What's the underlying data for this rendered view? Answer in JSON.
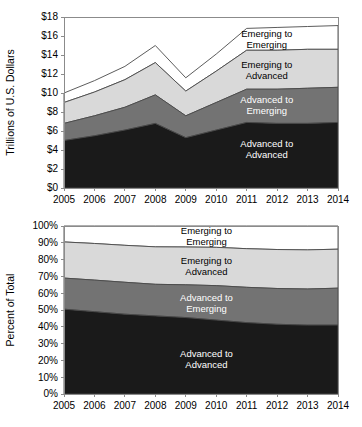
{
  "figure": {
    "background": "#ffffff",
    "series_colors": {
      "advanced_to_advanced": "#1a1a1a",
      "advanced_to_emerging": "#737373",
      "emerging_to_advanced": "#d9d9d9",
      "emerging_to_emerging": "#ffffff"
    },
    "outline_color": "#4a4a4a",
    "axis_color": "#8b8b8b"
  },
  "charts": [
    {
      "id": "top",
      "type": "area",
      "title": "",
      "xlabel": "",
      "ylabel": "Trillions of U.S. Dollars",
      "stacked": true,
      "grid": false,
      "legend_position": "inline-annotations",
      "x": [
        2005,
        2006,
        2007,
        2008,
        2009,
        2010,
        2011,
        2012,
        2013,
        2014
      ],
      "xtick_labels": [
        "2005",
        "2006",
        "2007",
        "2008",
        "2009",
        "2010",
        "2011",
        "2012",
        "2013",
        "2014"
      ],
      "ytick_labels": [
        "$0",
        "$2",
        "$4",
        "$6",
        "$8",
        "$10",
        "$12",
        "$14",
        "$16",
        "$18"
      ],
      "ytick_values": [
        0,
        2,
        4,
        6,
        8,
        10,
        12,
        14,
        16,
        18
      ],
      "ylim": [
        0,
        18
      ],
      "series": [
        {
          "name": "Advanced to Advanced",
          "label_lines": [
            "Advanced to",
            "Advanced"
          ],
          "color_key": "advanced_to_advanced",
          "label_color": "light",
          "values": [
            5.0,
            5.5,
            6.1,
            6.8,
            5.3,
            6.1,
            6.9,
            6.8,
            6.8,
            6.9
          ]
        },
        {
          "name": "Advanced to Emerging",
          "label_lines": [
            "Advanced to",
            "Emerging"
          ],
          "color_key": "advanced_to_emerging",
          "label_color": "light",
          "values": [
            1.8,
            2.1,
            2.4,
            3.0,
            2.3,
            2.9,
            3.5,
            3.6,
            3.7,
            3.7
          ]
        },
        {
          "name": "Emerging to Advanced",
          "label_lines": [
            "Emerging to",
            "Advanced"
          ],
          "color_key": "emerging_to_advanced",
          "label_color": "dark",
          "values": [
            2.2,
            2.5,
            2.9,
            3.4,
            2.6,
            3.3,
            4.1,
            4.1,
            4.1,
            4.0
          ]
        },
        {
          "name": "Emerging to Emerging",
          "label_lines": [
            "Emerging to",
            "Emerging"
          ],
          "color_key": "emerging_to_emerging",
          "label_color": "dark",
          "values": [
            1.0,
            1.2,
            1.4,
            1.8,
            1.4,
            1.8,
            2.3,
            2.4,
            2.4,
            2.5
          ]
        }
      ],
      "annotations": [
        {
          "text_lines": [
            "Emerging to",
            "Emerging"
          ],
          "x_frac": 0.74,
          "y_value": 15.9,
          "color": "dark"
        },
        {
          "text_lines": [
            "Emerging to",
            "Advanced"
          ],
          "x_frac": 0.74,
          "y_value": 12.6,
          "color": "dark"
        },
        {
          "text_lines": [
            "Advanced to",
            "Emerging"
          ],
          "x_frac": 0.74,
          "y_value": 8.9,
          "color": "light"
        },
        {
          "text_lines": [
            "Advanced to",
            "Advanced"
          ],
          "x_frac": 0.74,
          "y_value": 4.3,
          "color": "light"
        }
      ]
    },
    {
      "id": "bottom",
      "type": "area",
      "title": "",
      "xlabel": "",
      "ylabel": "Percent of Total",
      "stacked": true,
      "grid": false,
      "legend_position": "inline-annotations",
      "x": [
        2005,
        2006,
        2007,
        2008,
        2009,
        2010,
        2011,
        2012,
        2013,
        2014
      ],
      "xtick_labels": [
        "2005",
        "2006",
        "2007",
        "2008",
        "2009",
        "2010",
        "2011",
        "2012",
        "2013",
        "2014"
      ],
      "ytick_labels": [
        "0%",
        "10%",
        "20%",
        "30%",
        "40%",
        "50%",
        "60%",
        "70%",
        "80%",
        "90%",
        "100%"
      ],
      "ytick_values": [
        0,
        10,
        20,
        30,
        40,
        50,
        60,
        70,
        80,
        90,
        100
      ],
      "ylim": [
        0,
        100
      ],
      "series": [
        {
          "name": "Advanced to Advanced",
          "label_lines": [
            "Advanced to",
            "Advanced"
          ],
          "color_key": "advanced_to_advanced",
          "label_color": "light",
          "values": [
            50.5,
            49.0,
            47.5,
            46.5,
            45.5,
            44.0,
            42.5,
            41.5,
            41.0,
            41.0
          ]
        },
        {
          "name": "Advanced to Emerging",
          "label_lines": [
            "Advanced to",
            "Emerging"
          ],
          "color_key": "advanced_to_emerging",
          "label_color": "light",
          "values": [
            18.5,
            18.8,
            19.0,
            18.8,
            19.5,
            20.5,
            21.0,
            21.3,
            21.5,
            22.0
          ]
        },
        {
          "name": "Emerging to Advanced",
          "label_lines": [
            "Emerging to",
            "Advanced"
          ],
          "color_key": "emerging_to_advanced",
          "label_color": "dark",
          "values": [
            21.5,
            21.8,
            22.0,
            22.3,
            22.5,
            22.8,
            23.0,
            23.2,
            23.3,
            23.2
          ]
        },
        {
          "name": "Emerging to Emerging",
          "label_lines": [
            "Emerging to",
            "Emerging"
          ],
          "color_key": "emerging_to_emerging",
          "label_color": "dark",
          "values": [
            9.5,
            10.4,
            11.5,
            12.4,
            12.5,
            12.7,
            13.5,
            14.0,
            14.2,
            13.8
          ]
        }
      ],
      "annotations": [
        {
          "text_lines": [
            "Emerging to",
            "Emerging"
          ],
          "x_frac": 0.52,
          "y_value": 95.0,
          "color": "dark"
        },
        {
          "text_lines": [
            "Emerging to",
            "Advanced"
          ],
          "x_frac": 0.52,
          "y_value": 77.5,
          "color": "dark"
        },
        {
          "text_lines": [
            "Advanced to",
            "Emerging"
          ],
          "x_frac": 0.52,
          "y_value": 55.5,
          "color": "light"
        },
        {
          "text_lines": [
            "Advanced to",
            "Advanced"
          ],
          "x_frac": 0.52,
          "y_value": 22.0,
          "color": "light"
        }
      ]
    }
  ],
  "chart_data": {
    "type": "area",
    "title": "",
    "charts": [
      {
        "panel": "top",
        "type": "area",
        "stacked": true,
        "title": "",
        "xlabel": "",
        "ylabel": "Trillions of U.S. Dollars",
        "ylim": [
          0,
          18
        ],
        "yticks": [
          0,
          2,
          4,
          6,
          8,
          10,
          12,
          14,
          16,
          18
        ],
        "ytick_labels": [
          "$0",
          "$2",
          "$4",
          "$6",
          "$8",
          "$10",
          "$12",
          "$14",
          "$16",
          "$18"
        ],
        "categories": [
          "2005",
          "2006",
          "2007",
          "2008",
          "2009",
          "2010",
          "2011",
          "2012",
          "2013",
          "2014"
        ],
        "grid": false,
        "legend_position": "inline-annotations",
        "series": [
          {
            "name": "Advanced to Advanced",
            "values": [
              5.0,
              5.5,
              6.1,
              6.8,
              5.3,
              6.1,
              6.9,
              6.8,
              6.8,
              6.9
            ]
          },
          {
            "name": "Advanced to Emerging",
            "values": [
              1.8,
              2.1,
              2.4,
              3.0,
              2.3,
              2.9,
              3.5,
              3.6,
              3.7,
              3.7
            ]
          },
          {
            "name": "Emerging to Advanced",
            "values": [
              2.2,
              2.5,
              2.9,
              3.4,
              2.6,
              3.3,
              4.1,
              4.1,
              4.1,
              4.0
            ]
          },
          {
            "name": "Emerging to Emerging",
            "values": [
              1.0,
              1.2,
              1.4,
              1.8,
              1.4,
              1.8,
              2.3,
              2.4,
              2.4,
              2.5
            ]
          }
        ],
        "cumulative_tops": [
          {
            "name": "Advanced to Advanced",
            "values": [
              5.0,
              5.5,
              6.1,
              6.8,
              5.3,
              6.1,
              6.9,
              6.8,
              6.8,
              6.9
            ]
          },
          {
            "name": "Advanced to Emerging",
            "values": [
              6.8,
              7.6,
              8.5,
              9.8,
              7.6,
              9.0,
              10.4,
              10.4,
              10.5,
              10.6
            ]
          },
          {
            "name": "Emerging to Advanced",
            "values": [
              9.0,
              10.1,
              11.4,
              13.2,
              10.2,
              12.3,
              14.5,
              14.5,
              14.6,
              14.6
            ]
          },
          {
            "name": "Emerging to Emerging",
            "values": [
              10.0,
              11.3,
              12.8,
              15.0,
              11.6,
              14.1,
              16.8,
              16.9,
              17.0,
              17.1
            ]
          }
        ]
      },
      {
        "panel": "bottom",
        "type": "area",
        "stacked": true,
        "title": "",
        "xlabel": "",
        "ylabel": "Percent of Total",
        "ylim": [
          0,
          100
        ],
        "yticks": [
          0,
          10,
          20,
          30,
          40,
          50,
          60,
          70,
          80,
          90,
          100
        ],
        "ytick_labels": [
          "0%",
          "10%",
          "20%",
          "30%",
          "40%",
          "50%",
          "60%",
          "70%",
          "80%",
          "90%",
          "100%"
        ],
        "categories": [
          "2005",
          "2006",
          "2007",
          "2008",
          "2009",
          "2010",
          "2011",
          "2012",
          "2013",
          "2014"
        ],
        "grid": false,
        "legend_position": "inline-annotations",
        "series": [
          {
            "name": "Advanced to Advanced",
            "values": [
              50.5,
              49.0,
              47.5,
              46.5,
              45.5,
              44.0,
              42.5,
              41.5,
              41.0,
              41.0
            ]
          },
          {
            "name": "Advanced to Emerging",
            "values": [
              18.5,
              18.8,
              19.0,
              18.8,
              19.5,
              20.5,
              21.0,
              21.3,
              21.5,
              22.0
            ]
          },
          {
            "name": "Emerging to Advanced",
            "values": [
              21.5,
              21.8,
              22.0,
              22.3,
              22.5,
              22.8,
              23.0,
              23.2,
              23.3,
              23.2
            ]
          },
          {
            "name": "Emerging to Emerging",
            "values": [
              9.5,
              10.4,
              11.5,
              12.4,
              12.5,
              12.7,
              13.5,
              14.0,
              14.2,
              13.8
            ]
          }
        ],
        "cumulative_tops": [
          {
            "name": "Advanced to Advanced",
            "values": [
              50.5,
              49.0,
              47.5,
              46.5,
              45.5,
              44.0,
              42.5,
              41.5,
              41.0,
              41.0
            ]
          },
          {
            "name": "Advanced to Emerging",
            "values": [
              69.0,
              67.8,
              66.5,
              65.3,
              65.0,
              64.5,
              63.5,
              62.8,
              62.5,
              63.0
            ]
          },
          {
            "name": "Emerging to Advanced",
            "values": [
              90.5,
              89.6,
              88.5,
              87.6,
              87.5,
              87.3,
              86.5,
              86.0,
              85.8,
              86.2
            ]
          },
          {
            "name": "Emerging to Emerging",
            "values": [
              100,
              100,
              100,
              100,
              100,
              100,
              100,
              100,
              100,
              100
            ]
          }
        ]
      }
    ]
  }
}
